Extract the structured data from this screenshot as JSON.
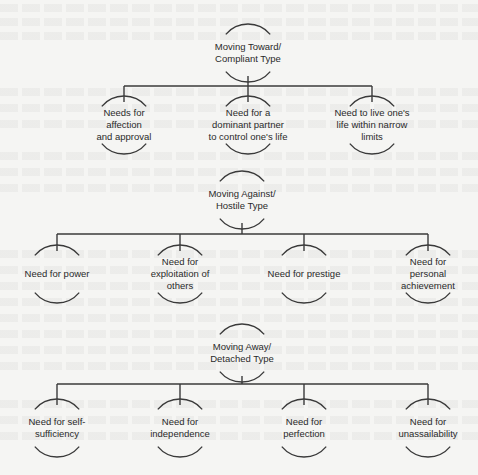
{
  "colors": {
    "background": "#f5f5f3",
    "line": "#3a3a3a",
    "text": "#2a2a2a"
  },
  "groups": [
    {
      "id": "moving-toward",
      "root": {
        "label": "Moving Toward/\nCompliant Type",
        "cx": 248,
        "cy": 53
      },
      "bar_y": 86,
      "children": [
        {
          "label": "Needs for\naffection\nand approval",
          "cx": 124,
          "cy": 125
        },
        {
          "label": "Need for a\ndominant partner\nto control one's life",
          "cx": 248,
          "cy": 125
        },
        {
          "label": "Need to live one's\nlife within narrow\nlimits",
          "cx": 372,
          "cy": 125
        }
      ]
    },
    {
      "id": "moving-against",
      "root": {
        "label": "Moving Against/\nHostile Type",
        "cx": 242,
        "cy": 200
      },
      "bar_y": 234,
      "children": [
        {
          "label": "Need for power",
          "cx": 57,
          "cy": 274
        },
        {
          "label": "Need for\nexploitation of\nothers",
          "cx": 180,
          "cy": 274
        },
        {
          "label": "Need for prestige",
          "cx": 304,
          "cy": 274
        },
        {
          "label": "Need for\npersonal\nachievement",
          "cx": 428,
          "cy": 274
        }
      ]
    },
    {
      "id": "moving-away",
      "root": {
        "label": "Moving Away/\nDetached Type",
        "cx": 242,
        "cy": 353
      },
      "bar_y": 384,
      "children": [
        {
          "label": "Need for self-\nsufficiency",
          "cx": 57,
          "cy": 428
        },
        {
          "label": "Need for\nindependence",
          "cx": 180,
          "cy": 428
        },
        {
          "label": "Need for\nperfection",
          "cx": 304,
          "cy": 428
        },
        {
          "label": "Need for\nunassailability",
          "cx": 428,
          "cy": 428
        }
      ]
    }
  ]
}
